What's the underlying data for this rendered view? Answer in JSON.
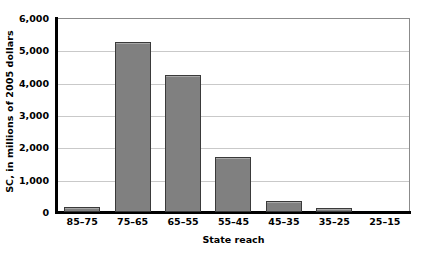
{
  "chart_data": {
    "type": "bar",
    "title": "",
    "subtitle": "",
    "xlabel": "State reach",
    "ylabel": "SC, in millions of 2005 dollars",
    "categories": [
      "85–75",
      "75–65",
      "65–55",
      "55–45",
      "45–35",
      "35–25",
      "25–15"
    ],
    "values": [
      150,
      5250,
      4250,
      1700,
      330,
      130,
      0
    ],
    "series": [
      {
        "name": "SC",
        "values": [
          150,
          5250,
          4250,
          1700,
          330,
          130,
          0
        ]
      }
    ],
    "ylim": [
      0,
      6000
    ],
    "ytick_values": [
      0,
      1000,
      2000,
      3000,
      4000,
      5000,
      6000
    ],
    "ytick_labels": [
      "0",
      "1,000",
      "2,000",
      "3,000",
      "4,000",
      "5,000",
      "6,000"
    ],
    "grid": true,
    "grid_axis": "y",
    "legend": false,
    "legend_position": "none",
    "bar_color": "#808080",
    "bar_border_color": "#3a3a3a",
    "gridline_color": "#c9c9c9",
    "axis_color": "#000000",
    "background_color": "#ffffff"
  }
}
